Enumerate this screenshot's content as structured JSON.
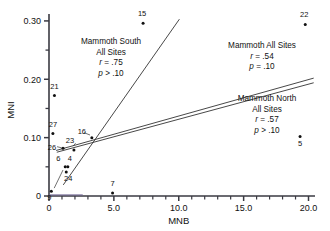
{
  "chart_data": {
    "type": "scatter",
    "title": "",
    "xlabel": "MNB",
    "ylabel": "MNI",
    "xlim": [
      0,
      20.5
    ],
    "ylim": [
      0,
      0.305
    ],
    "grid": false,
    "legend_position": "none",
    "x_major_ticks": [
      "0",
      "5.0",
      "10.0",
      "15.0",
      "20.0"
    ],
    "x_major_values": [
      0,
      5,
      10,
      15,
      20
    ],
    "x_minor_step": 1.0,
    "y_major_ticks": [
      "0",
      "0.10",
      "0.20",
      "0.30"
    ],
    "y_major_values": [
      0,
      0.1,
      0.2,
      0.3
    ],
    "y_minor_step": 0.05,
    "points": [
      {
        "label": "15",
        "x": 7.25,
        "y": 0.296,
        "label_dx": -1,
        "label_dy": -7
      },
      {
        "label": "22",
        "x": 19.75,
        "y": 0.294,
        "label_dx": -1,
        "label_dy": -7
      },
      {
        "label": "21",
        "x": 0.42,
        "y": 0.172,
        "label_dx": 0,
        "label_dy": -7
      },
      {
        "label": "27",
        "x": 0.3,
        "y": 0.107,
        "label_dx": 0,
        "label_dy": -7
      },
      {
        "label": "5",
        "x": 19.35,
        "y": 0.102,
        "label_dx": 0,
        "label_dy": 10
      },
      {
        "label": "16",
        "x": 3.3,
        "y": 0.1,
        "label_dx": -10,
        "label_dy": -4
      },
      {
        "label": "26",
        "x": 1.08,
        "y": 0.082,
        "label_dx": -11,
        "label_dy": 2
      },
      {
        "label": "23",
        "x": 1.92,
        "y": 0.079,
        "label_dx": -4,
        "label_dy": -7
      },
      {
        "label": "6",
        "x": 1.25,
        "y": 0.05,
        "label_dx": -7,
        "label_dy": -6
      },
      {
        "label": "4",
        "x": 1.45,
        "y": 0.05,
        "label_dx": 2,
        "label_dy": -6
      },
      {
        "label": "24",
        "x": 1.33,
        "y": 0.041,
        "label_dx": 2,
        "label_dy": 9
      },
      {
        "label": "9",
        "x": 0.18,
        "y": 0.008,
        "label_dx": -2,
        "label_dy": 9
      },
      {
        "label": "7",
        "x": 4.9,
        "y": 0.005,
        "label_dx": 0,
        "label_dy": -7
      }
    ],
    "regression_lines": [
      {
        "name": "mammoth-south",
        "x0": 1.1,
        "y0": 0.019,
        "x1": 10.05,
        "y1": 0.303
      },
      {
        "name": "mammoth-all",
        "x0": 0.55,
        "y0": 0.078,
        "x1": 20.4,
        "y1": 0.202
      },
      {
        "name": "mammoth-north",
        "x0": 0.6,
        "y0": 0.075,
        "x1": 20.4,
        "y1": 0.194
      }
    ],
    "annotations": [
      {
        "name": "mammoth-south-annotation",
        "line1": "Mammoth South",
        "line2": "All Sites",
        "r_label": "r",
        "r_value": "= .75",
        "p_label": "p",
        "p_value": "> .10",
        "x": 111,
        "y": 44,
        "align": "middle"
      },
      {
        "name": "mammoth-all-annotation",
        "line1": "Mammoth All Sites",
        "line2": "",
        "r_label": "r",
        "r_value": "= .54",
        "p_label": "p",
        "p_value": "= .10",
        "x": 262,
        "y": 48,
        "align": "middle"
      },
      {
        "name": "mammoth-north-annotation",
        "line1": "Mammoth North",
        "line2": "All Sites",
        "r_label": "r",
        "r_value": "= .57",
        "p_label": "p",
        "p_value": "> .10",
        "x": 267,
        "y": 101,
        "align": "middle"
      }
    ]
  },
  "colors": {
    "axis": "#3a3a42",
    "point": "#111111",
    "line": "#333333",
    "baseline_accent": "#6a5f8f",
    "text": "#111111",
    "background": "#ffffff"
  }
}
